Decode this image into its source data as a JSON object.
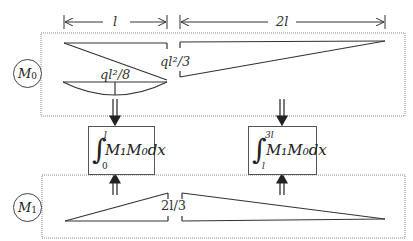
{
  "dimensions": {
    "left_span": "l",
    "right_span": "2l"
  },
  "m0_panel": {
    "label": "M0",
    "label_main": "M",
    "label_sub": "0",
    "triangle_peak_value": "ql²/3",
    "parabola_peak_value": "ql²/8"
  },
  "integrals": [
    {
      "upper": "l",
      "lower": "0",
      "expression": "M₁M₀dx"
    },
    {
      "upper": "3l",
      "lower": "l",
      "expression": "M₁M₀dx"
    }
  ],
  "m1_panel": {
    "label": "M1",
    "label_main": "M",
    "label_sub": "1",
    "peak_value": "2l/3"
  },
  "colors": {
    "line": "#333333",
    "dotted_border": "#888888",
    "background": "#ffffff"
  }
}
